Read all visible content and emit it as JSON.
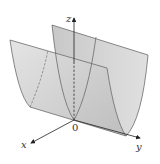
{
  "figure": {
    "axes": {
      "x_label": "x",
      "y_label": "y",
      "z_label": "z",
      "origin_label": "0"
    },
    "colors": {
      "surface_fill": "#d6d6d6",
      "surface_fill_dark": "#bdbdbd",
      "edge": "#6b6b6b",
      "axis": "#222222"
    }
  }
}
